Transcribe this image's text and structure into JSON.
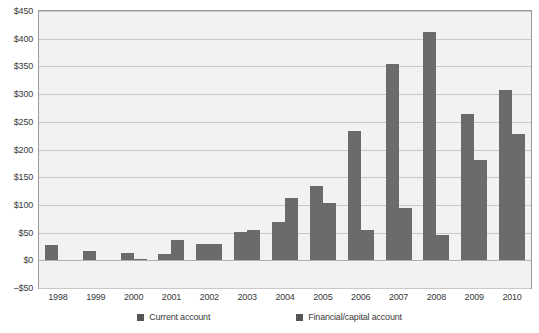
{
  "chart_data": {
    "type": "bar",
    "title": "",
    "xlabel": "",
    "ylabel": "",
    "ylim": [
      -50,
      450
    ],
    "ytick_step": 50,
    "grid": true,
    "legend_position": "bottom",
    "currency_prefix": "$",
    "categories": [
      "1998",
      "1999",
      "2000",
      "2001",
      "2002",
      "2003",
      "2004",
      "2005",
      "2006",
      "2007",
      "2008",
      "2009",
      "2010"
    ],
    "ytick_labels": [
      "$450",
      "$400",
      "$350",
      "$300",
      "$250",
      "$200",
      "$150",
      "$100",
      "$50",
      "$0",
      "–$50"
    ],
    "ytick_values": [
      450,
      400,
      350,
      300,
      250,
      200,
      150,
      100,
      50,
      0,
      -50
    ],
    "series": [
      {
        "name": "Current account",
        "color": "#6b6b6b",
        "values": [
          28,
          16,
          14,
          12,
          30,
          52,
          69,
          135,
          233,
          355,
          413,
          265,
          308
        ]
      },
      {
        "name": "Financial/capital account",
        "color": "#6b6b6b",
        "values": [
          0,
          0,
          2,
          36,
          30,
          54,
          112,
          103,
          54,
          95,
          46,
          182,
          228
        ]
      }
    ]
  },
  "legend": {
    "items": [
      {
        "label": "Current account",
        "color": "#555555"
      },
      {
        "label": "Financial/capital account",
        "color": "#555555"
      }
    ]
  }
}
